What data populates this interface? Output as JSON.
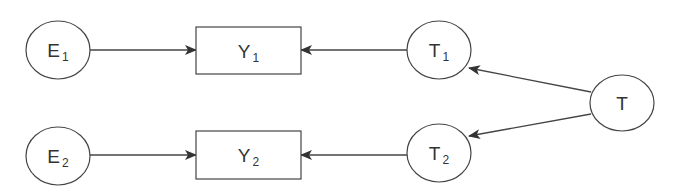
{
  "diagram": {
    "colors": {
      "stroke": "#444444",
      "text": "#333333",
      "background": "#ffffff"
    },
    "nodes": [
      {
        "id": "E1",
        "shape": "ellipse",
        "label": "E",
        "subscript": "1",
        "cx": 58,
        "cy": 50,
        "rx": 32,
        "ry": 29
      },
      {
        "id": "Y1",
        "shape": "rect",
        "label": "Y",
        "subscript": "1",
        "x": 196,
        "y": 27,
        "w": 105,
        "h": 47
      },
      {
        "id": "T1",
        "shape": "ellipse",
        "label": "T",
        "subscript": "1",
        "cx": 439,
        "cy": 50,
        "rx": 32,
        "ry": 29
      },
      {
        "id": "T",
        "shape": "ellipse",
        "label": "T",
        "subscript": "",
        "cx": 622,
        "cy": 103,
        "rx": 32,
        "ry": 28
      },
      {
        "id": "E2",
        "shape": "ellipse",
        "label": "E",
        "subscript": "2",
        "cx": 58,
        "cy": 156,
        "rx": 32,
        "ry": 29
      },
      {
        "id": "Y2",
        "shape": "rect",
        "label": "Y",
        "subscript": "2",
        "x": 196,
        "y": 131,
        "w": 105,
        "h": 48
      },
      {
        "id": "T2",
        "shape": "ellipse",
        "label": "T",
        "subscript": "2",
        "cx": 439,
        "cy": 153,
        "rx": 32,
        "ry": 29
      }
    ],
    "edges": [
      {
        "from": "E1",
        "to": "Y1",
        "x1": 90,
        "y1": 50,
        "x2": 196,
        "y2": 50
      },
      {
        "from": "T1",
        "to": "Y1",
        "x1": 407,
        "y1": 50,
        "x2": 301,
        "y2": 50
      },
      {
        "from": "E2",
        "to": "Y2",
        "x1": 90,
        "y1": 155,
        "x2": 196,
        "y2": 155
      },
      {
        "from": "T2",
        "to": "Y2",
        "x1": 407,
        "y1": 155,
        "x2": 301,
        "y2": 155
      },
      {
        "from": "T",
        "to": "T1",
        "x1": 591,
        "y1": 92,
        "x2": 469,
        "y2": 68
      },
      {
        "from": "T",
        "to": "T2",
        "x1": 591,
        "y1": 114,
        "x2": 469,
        "y2": 136
      }
    ]
  }
}
